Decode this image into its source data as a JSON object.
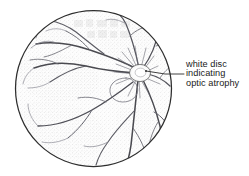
{
  "figure": {
    "background_color": "#ffffff"
  },
  "annotation": {
    "name": "white-disc-callout",
    "line_1": "white disc",
    "line_2": "indicating",
    "line_3": "optic atrophy",
    "full_text": "white disc indicating optic atrophy",
    "text_color": "#1a1a1a",
    "leader_line_color": "#2b2b2b"
  },
  "illustration": {
    "type": "line-drawing",
    "subject": "fundus",
    "fundus_circle": {
      "name": "fundus-circle",
      "center_x": 93.5,
      "center_y": 88.5,
      "radius": 79,
      "outline_color": "#2e2e2e",
      "fill_color": "#fbfbfb",
      "stipple_color": "#d8d8d8"
    },
    "optic_disc": {
      "name": "optic-disc",
      "center_x": 140,
      "center_y": 73,
      "radius_x": 10.5,
      "radius_y": 8.5,
      "fill_color": "#ffffff",
      "outline_color": "#555555",
      "description": "pale white disc"
    },
    "macula_ring": {
      "name": "macula-ring",
      "center_x": 123,
      "center_y": 88,
      "radius_x": 13,
      "radius_y": 11,
      "outline_color": "#6a6a6a"
    },
    "vessel_color": "#4a4a50",
    "vessel_color_light": "#7d7d85",
    "vessel_count": 14
  },
  "colors": {
    "ink": "#2e2e2e",
    "vessel": "#4a4a50",
    "vessel_light": "#7d7d85",
    "texture": "#d8d8d8",
    "paper": "#ffffff"
  }
}
